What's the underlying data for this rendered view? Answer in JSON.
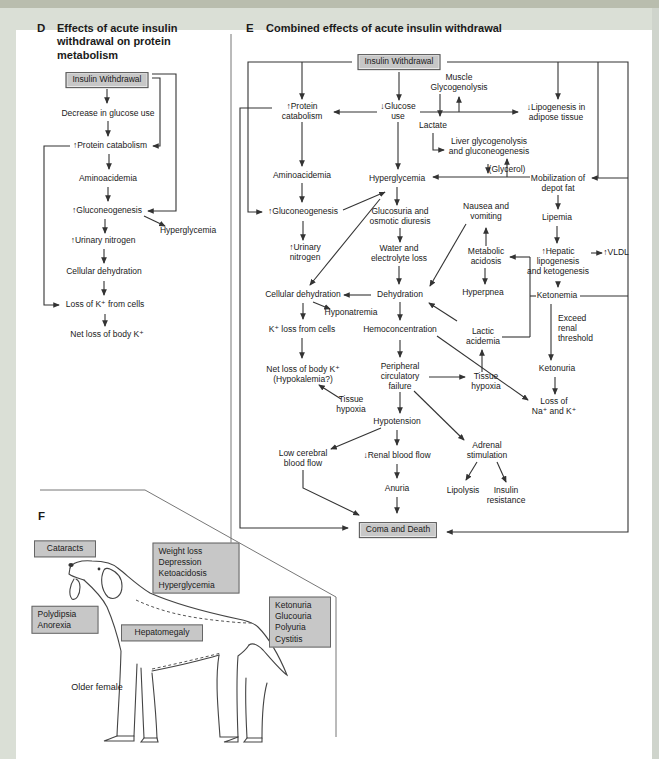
{
  "figure": {
    "panel_d": {
      "letter": "D",
      "title": "Effects of acute insulin withdrawal on protein metabolism",
      "nodes": [
        {
          "label": "Insulin Withdrawal",
          "x": 107,
          "y": 80,
          "box": true
        },
        {
          "label": "Decrease in glucose use",
          "x": 108,
          "y": 114
        },
        {
          "label": "↑Protein catabolism",
          "x": 110,
          "y": 146
        },
        {
          "label": "Aminoacidemia",
          "x": 108,
          "y": 179
        },
        {
          "label": "↑Gluconeogenesis",
          "x": 107,
          "y": 211
        },
        {
          "label": "Hyperglycemia",
          "x": 188,
          "y": 231
        },
        {
          "label": "↑Urinary nitrogen",
          "x": 103,
          "y": 241
        },
        {
          "label": "Cellular dehydration",
          "x": 104,
          "y": 272
        },
        {
          "label": "Loss of K⁺ from cells",
          "x": 105,
          "y": 305
        },
        {
          "label": "Net loss of body K⁺",
          "x": 107,
          "y": 335
        }
      ],
      "edges": [
        "Insulin Withdrawal -> Decrease in glucose use",
        "Decrease in glucose use -> ↑Protein catabolism",
        "Insulin Withdrawal -> ↑Protein catabolism",
        "↑Protein catabolism -> Aminoacidemia",
        "Aminoacidemia -> ↑Gluconeogenesis",
        "Insulin Withdrawal -> ↑Gluconeogenesis",
        "↑Gluconeogenesis -> Hyperglycemia",
        "↑Gluconeogenesis -> ↑Urinary nitrogen",
        "↑Urinary nitrogen -> Cellular dehydration",
        "Cellular dehydration -> Loss of K⁺ from cells",
        "↑Protein catabolism -> Loss of K⁺ from cells",
        "Loss of K⁺ from cells -> Net loss of body K⁺"
      ]
    },
    "panel_e": {
      "letter": "E",
      "title": "Combined effects of acute insulin withdrawal",
      "nodes": [
        {
          "label": "Insulin Withdrawal",
          "x": 399,
          "y": 62,
          "box": true
        },
        {
          "label": "↑Protein\ncatabolism",
          "x": 302,
          "y": 112
        },
        {
          "label": "↓Glucose\nuse",
          "x": 398,
          "y": 112
        },
        {
          "label": "Muscle\nGlycogenolysis",
          "x": 459,
          "y": 83
        },
        {
          "label": "Lactate",
          "x": 433,
          "y": 126
        },
        {
          "label": "Liver glycogenolysis\nand gluconeogenesis",
          "x": 489,
          "y": 147
        },
        {
          "label": "↓Lipogenesis in\nadipose tissue",
          "x": 556,
          "y": 113
        },
        {
          "label": "(Glycerol)",
          "x": 507,
          "y": 170
        },
        {
          "label": "Mobilization of\ndepot fat",
          "x": 558,
          "y": 184
        },
        {
          "label": "Aminoacidemia",
          "x": 302,
          "y": 176
        },
        {
          "label": "Hyperglycemia",
          "x": 397,
          "y": 179
        },
        {
          "label": "↑Gluconeogenesis",
          "x": 303,
          "y": 212
        },
        {
          "label": "Glucosuria and\nosmotic diuresis",
          "x": 400,
          "y": 217
        },
        {
          "label": "↑Urinary\nnitrogen",
          "x": 305,
          "y": 253
        },
        {
          "label": "Water and\nelectrolyte loss",
          "x": 399,
          "y": 254
        },
        {
          "label": "Nausea and\nvomiting",
          "x": 486,
          "y": 212
        },
        {
          "label": "Metabolic\nacidosis",
          "x": 486,
          "y": 257
        },
        {
          "label": "Lipemia",
          "x": 557,
          "y": 218
        },
        {
          "label": "↑Hepatic\nlipogenesis\nand ketogenesis",
          "x": 558,
          "y": 262
        },
        {
          "label": "↑VLDL",
          "x": 616,
          "y": 253
        },
        {
          "label": "Cellular dehydration",
          "x": 303,
          "y": 295
        },
        {
          "label": "Dehydration",
          "x": 400,
          "y": 295
        },
        {
          "label": "Hyponatremia",
          "x": 351,
          "y": 313
        },
        {
          "label": "Hyperpnea",
          "x": 483,
          "y": 293
        },
        {
          "label": "Ketonemia",
          "x": 557,
          "y": 296
        },
        {
          "label": "K⁺ loss from cells",
          "x": 302,
          "y": 330
        },
        {
          "label": "Hemoconcentration",
          "x": 400,
          "y": 330
        },
        {
          "label": "Lactic\nacidemia",
          "x": 483,
          "y": 337
        },
        {
          "label": "Exceed\nrenal\nthreshold",
          "x": 558,
          "y": 329,
          "align": "left"
        },
        {
          "label": "Ketonuria",
          "x": 557,
          "y": 369
        },
        {
          "label": "Loss of\nNa⁺ and K⁺",
          "x": 554,
          "y": 407
        },
        {
          "label": "Net loss of body K⁺\n(Hypokalemia?)",
          "x": 303,
          "y": 375
        },
        {
          "label": "Peripheral\ncirculatory\nfailure",
          "x": 400,
          "y": 377
        },
        {
          "label": "Tissue\nhypoxia",
          "x": 351,
          "y": 405
        },
        {
          "label": "Tissue\nhypoxia",
          "x": 486,
          "y": 382
        },
        {
          "label": "Hypotension",
          "x": 397,
          "y": 422
        },
        {
          "label": "Adrenal\nstimulation",
          "x": 487,
          "y": 451
        },
        {
          "label": "Low cerebral\nblood flow",
          "x": 303,
          "y": 459
        },
        {
          "label": "↓Renal blood flow",
          "x": 397,
          "y": 456
        },
        {
          "label": "Anuria",
          "x": 397,
          "y": 489
        },
        {
          "label": "Lipolysis",
          "x": 463,
          "y": 491
        },
        {
          "label": "Insulin\nresistance",
          "x": 506,
          "y": 496
        },
        {
          "label": "Coma and Death",
          "x": 398,
          "y": 530,
          "box": true
        }
      ],
      "edges": [
        "Insulin Withdrawal -> ↑Protein catabolism",
        "Insulin Withdrawal -> ↓Glucose use",
        "Insulin Withdrawal -> ↑Gluconeogenesis",
        "Insulin Withdrawal -> ↓Lipogenesis in adipose tissue",
        "Insulin Withdrawal -> Mobilization of depot fat",
        "↓Glucose use -> ↑Protein catabolism",
        "↓Glucose use -> Muscle Glycogenolysis",
        "↓Glucose use -> ↓Lipogenesis in adipose tissue",
        "↓Glucose use -> Hyperglycemia",
        "Muscle Glycogenolysis -> Lactate",
        "Lactate -> Liver glycogenolysis and gluconeogenesis",
        "↑Protein catabolism -> Aminoacidemia",
        "Aminoacidemia -> ↑Gluconeogenesis",
        "↑Gluconeogenesis -> Hyperglycemia",
        "↑Gluconeogenesis -> ↑Urinary nitrogen",
        "Hyperglycemia -> Glucosuria and osmotic diuresis",
        "Hyperglycemia -> Cellular dehydration",
        "Glucosuria and osmotic diuresis -> Water and electrolyte loss",
        "Water and electrolyte loss -> Dehydration",
        "Nausea and vomiting -> Dehydration",
        "Hyperpnea -> Dehydration",
        "Dehydration -> Cellular dehydration",
        "Dehydration -> Hemoconcentration",
        "Cellular dehydration -> Hyponatremia",
        "Cellular dehydration -> K⁺ loss from cells",
        "K⁺ loss from cells -> Net loss of body K⁺ (Hypokalemia?)",
        "Tissue hypoxia -> Net loss of body K⁺ (Hypokalemia?)",
        "Hemoconcentration -> Peripheral circulatory failure",
        "Hemoconcentration -> Loss of Na⁺ and K⁺",
        "Peripheral circulatory failure -> Tissue hypoxia",
        "Peripheral circulatory failure -> Hypotension",
        "Peripheral circulatory failure -> Adrenal stimulation",
        "Tissue hypoxia -> Lactic acidemia",
        "Lactic acidemia -> Metabolic acidosis",
        "Ketonemia -> Metabolic acidosis",
        "Metabolic acidosis -> Nausea and vomiting",
        "Metabolic acidosis -> Hyperpnea",
        "Mobilization of depot fat -> (Glycerol) -> Hyperglycemia",
        "(Glycerol) -> Liver glycogenolysis and gluconeogenesis",
        "Mobilization of depot fat -> Lipemia",
        "Lipemia -> ↑Hepatic lipogenesis and ketogenesis",
        "↑Hepatic lipogenesis and ketogenesis -> ↑VLDL",
        "↑Hepatic lipogenesis and ketogenesis -> Ketonemia",
        "Ketonemia -> Ketonuria (Exceed renal threshold)",
        "Ketonuria -> Loss of Na⁺ and K⁺",
        "Hypotension -> Low cerebral blood flow",
        "Hypotension -> ↓Renal blood flow",
        "↓Renal blood flow -> Anuria",
        "Anuria -> Coma and Death",
        "Low cerebral blood flow -> Coma and Death",
        "↑Protein catabolism -> Coma and Death",
        "Ketonemia -> Coma and Death",
        "Adrenal stimulation -> Lipolysis",
        "Adrenal stimulation -> Insulin resistance"
      ]
    },
    "panel_f": {
      "letter": "F",
      "caption": "Older female",
      "boxes": [
        {
          "label": "Cataracts",
          "x": 65,
          "y": 549,
          "w": 50
        },
        {
          "label": "Weight loss\nDepression\nKetoacidosis\nHyperglycemia",
          "x": 196,
          "y": 568,
          "w": 75,
          "align": "left"
        },
        {
          "label": "Polydipsia\nAnorexia",
          "x": 65,
          "y": 620,
          "w": 55,
          "align": "left"
        },
        {
          "label": "Hepatomegaly",
          "x": 162,
          "y": 633,
          "w": 70
        },
        {
          "label": "Ketonuria\nGlucouria\nPolyuria\nCystitis",
          "x": 300,
          "y": 622,
          "w": 50,
          "align": "left"
        }
      ]
    },
    "colors": {
      "box_fill": "#c7c7c7",
      "box_border": "#555555",
      "line": "#333333",
      "page_margin": "#d9ded5"
    }
  }
}
